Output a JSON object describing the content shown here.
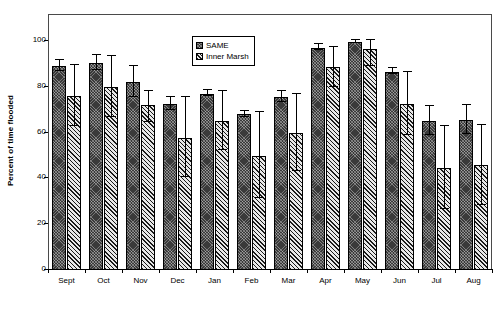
{
  "chart_data": {
    "type": "bar",
    "title": "",
    "xlabel": "",
    "ylabel": "Percent of time flooded",
    "ylim": [
      0,
      100
    ],
    "yticks": [
      0,
      20,
      40,
      60,
      80,
      100
    ],
    "ytick_labels": [
      "0",
      "20",
      "40",
      "60",
      "80",
      "100"
    ],
    "grid": false,
    "legend_position": "upper-center",
    "categories": [
      "Sept",
      "Oct",
      "Nov",
      "Dec",
      "Jan",
      "Feb",
      "Mar",
      "Apr",
      "May",
      "Jun",
      "Jul",
      "Aug"
    ],
    "series": [
      {
        "name": "SAME",
        "color": "#3a3a3a",
        "pattern": "dense-crosshatch",
        "values": [
          89,
          90.5,
          82,
          72.5,
          77,
          68,
          75.5,
          97,
          99.5,
          86.5,
          65,
          65.5
        ],
        "error_high": [
          91.5,
          94,
          89,
          75.5,
          78.5,
          69.5,
          78,
          98.5,
          100.5,
          88,
          71.5,
          72
        ],
        "error_low": [
          86.5,
          87,
          75,
          69.5,
          75.5,
          66.5,
          73,
          95.5,
          98.5,
          85,
          58.5,
          59
        ]
      },
      {
        "name": "Inner Marsh",
        "color": "#6e6e6e",
        "pattern": "diagonal-hatch",
        "values": [
          76,
          80,
          72,
          57.5,
          65,
          50,
          60,
          88.5,
          96.5,
          72.5,
          44.5,
          46
        ],
        "error_high": [
          89.5,
          93.5,
          78,
          75.5,
          78,
          69,
          77,
          97.5,
          100.5,
          86.5,
          63,
          63.5
        ],
        "error_low": [
          62.5,
          66.5,
          64,
          40,
          52,
          31,
          43,
          79.5,
          88.5,
          58.5,
          26,
          28
        ]
      }
    ]
  },
  "legend": {
    "items": [
      {
        "label": "SAME",
        "swatch": "same-swatch-icon"
      },
      {
        "label": "Inner Marsh",
        "swatch": "inner-marsh-swatch-icon"
      }
    ]
  }
}
